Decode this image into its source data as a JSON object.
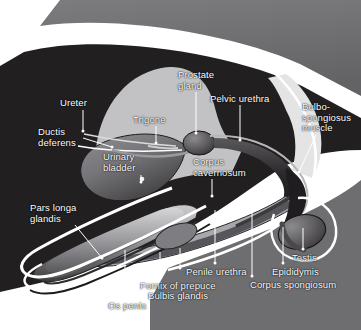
{
  "figure": {
    "type": "anatomical-diagram",
    "width": 361,
    "height": 330
  },
  "palette": {
    "background": "#ffffff",
    "body_dark": "#221f20",
    "body_mid_gray": "#6e6e70",
    "body_light_gray": "#b9b9bb",
    "tissue_pale": "#cfcfd1",
    "outline_white": "#ffffff",
    "label_text": "#ffffff",
    "leader_line": "#ffffff",
    "organ_mid": "#57575a",
    "organ_dark": "#3a383a",
    "highlight": "#e8e8e8"
  },
  "labels": [
    {
      "id": "ureter",
      "text": "Ureter",
      "x": 60,
      "y": 98,
      "align": "left",
      "leader": {
        "x1": 83,
        "y1": 110,
        "x2": 83,
        "y2": 131
      }
    },
    {
      "id": "ductis-deferens",
      "text": "Ductis\ndeferens",
      "x": 38,
      "y": 127,
      "align": "left",
      "leader": {
        "x1": 83,
        "y1": 138,
        "x2": 112,
        "y2": 147
      }
    },
    {
      "id": "trigone",
      "text": "Trigone",
      "x": 133,
      "y": 115,
      "align": "left",
      "leader": {
        "x1": 156,
        "y1": 126,
        "x2": 156,
        "y2": 143
      }
    },
    {
      "id": "prostate-gland",
      "text": "Prostate\ngland",
      "x": 178,
      "y": 70,
      "align": "left",
      "leader": {
        "x1": 196,
        "y1": 92,
        "x2": 196,
        "y2": 133
      }
    },
    {
      "id": "pelvic-urethra",
      "text": "Pelvic urethra",
      "x": 210,
      "y": 94,
      "align": "left",
      "leader": {
        "x1": 240,
        "y1": 105,
        "x2": 240,
        "y2": 140
      }
    },
    {
      "id": "bulbospongiosus",
      "text": "Bulbo-\nspongiosus\nmuscle",
      "x": 302,
      "y": 102,
      "align": "left",
      "leader": {
        "x1": 316,
        "y1": 135,
        "x2": 299,
        "y2": 172
      }
    },
    {
      "id": "urinary-bladder",
      "text": "Urinary\nbladder",
      "x": 103,
      "y": 152,
      "align": "left",
      "leader": {
        "x1": 141,
        "y1": 175,
        "x2": 141,
        "y2": 182
      }
    },
    {
      "id": "corpus-cavernosum",
      "text": "Corpus\ncavernosum",
      "x": 193,
      "y": 157,
      "align": "left",
      "leader": {
        "x1": 212,
        "y1": 179,
        "x2": 212,
        "y2": 196
      }
    },
    {
      "id": "pars-longa-glandis",
      "text": "Pars longa\nglandis",
      "x": 30,
      "y": 203,
      "align": "left",
      "leader": {
        "x1": 75,
        "y1": 225,
        "x2": 102,
        "y2": 258
      }
    },
    {
      "id": "os-penis",
      "text": "Os penis",
      "x": 108,
      "y": 301,
      "align": "left",
      "leader": {
        "x1": 125,
        "y1": 250,
        "x2": 125,
        "y2": 297
      }
    },
    {
      "id": "fornix-of-prepuce",
      "text": "Fornix of prepuce",
      "x": 140,
      "y": 281,
      "align": "left",
      "leader": {
        "x1": 160,
        "y1": 252,
        "x2": 160,
        "y2": 277
      }
    },
    {
      "id": "bulbis-glandis",
      "text": "Bulbis glandis",
      "x": 148,
      "y": 291,
      "align": "left",
      "leader": {
        "x1": 180,
        "y1": 248,
        "x2": 180,
        "y2": 268
      }
    },
    {
      "id": "penile-urethra",
      "text": "Penile urethra",
      "x": 186,
      "y": 267,
      "align": "left",
      "leader": {
        "x1": 215,
        "y1": 210,
        "x2": 215,
        "y2": 263
      }
    },
    {
      "id": "corpus-spongiosum",
      "text": "Corpus spongiosum",
      "x": 250,
      "y": 280,
      "align": "left",
      "leader": {
        "x1": 252,
        "y1": 205,
        "x2": 252,
        "y2": 276
      }
    },
    {
      "id": "epididymis",
      "text": "Epididymis",
      "x": 272,
      "y": 267,
      "align": "left",
      "leader": {
        "x1": 283,
        "y1": 227,
        "x2": 283,
        "y2": 263
      }
    },
    {
      "id": "testis",
      "text": "Testis",
      "x": 292,
      "y": 253,
      "align": "left",
      "leader": {
        "x1": 303,
        "y1": 228,
        "x2": 303,
        "y2": 249
      }
    }
  ],
  "structures": [
    {
      "id": "body-wall-dark",
      "name": "abdominal-body-mass"
    },
    {
      "id": "pelvic-bone",
      "name": "pelvic-bone-pale-mass"
    },
    {
      "id": "urinary-bladder",
      "name": "urinary-bladder-organ"
    },
    {
      "id": "prostate-gland",
      "name": "prostate-gland-organ"
    },
    {
      "id": "urethra-tube",
      "name": "urethra-tube"
    },
    {
      "id": "penis-shaft",
      "name": "penis-shaft"
    },
    {
      "id": "os-penis-bone",
      "name": "os-penis-bone"
    },
    {
      "id": "prepuce-sheath",
      "name": "prepuce-sheath-outline"
    },
    {
      "id": "testis",
      "name": "testis-organ"
    },
    {
      "id": "epididymis",
      "name": "epididymis-organ"
    },
    {
      "id": "bulbospongiosus",
      "name": "bulbospongiosus-muscle"
    }
  ]
}
